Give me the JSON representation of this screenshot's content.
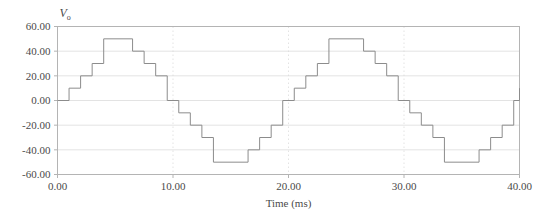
{
  "chart_data": {
    "type": "line",
    "title": "",
    "subtitle": "",
    "xlabel": "Time (ms)",
    "ylabel": "V",
    "ylabel_sub": "o",
    "xlim": [
      0.0,
      40.0
    ],
    "ylim": [
      -60.0,
      60.0
    ],
    "grid": true,
    "legend": false,
    "legend_position": "none",
    "xticks": [
      0.0,
      10.0,
      20.0,
      30.0,
      40.0
    ],
    "xtick_labels": [
      "0.00",
      "10.00",
      "20.00",
      "30.00",
      "40.00"
    ],
    "yticks": [
      -60.0,
      -40.0,
      -20.0,
      0.0,
      20.0,
      40.0,
      60.0
    ],
    "ytick_labels": [
      "-60.00",
      "-40.00",
      "-20.00",
      "0.00",
      "20.00",
      "40.00",
      "60.00"
    ],
    "line_color": "#8c8c8c",
    "grid_color": "#dcdcdc",
    "frame_color": "#b4b4b4",
    "series": [
      {
        "name": "Stepped sine output",
        "step_style": "post",
        "description": "11-level staircase approximation of a sine wave, amplitude 50 V, period 20 ms, two full cycles shown",
        "x": [
          0.0,
          1.0,
          2.0,
          3.0,
          4.0,
          6.5,
          7.5,
          8.5,
          9.5,
          10.5,
          11.5,
          12.5,
          13.5,
          16.5,
          17.5,
          18.5,
          19.5,
          20.5,
          21.5,
          22.5,
          23.5,
          26.5,
          27.5,
          28.5,
          29.5,
          30.5,
          31.5,
          32.5,
          33.5,
          36.5,
          37.5,
          38.5,
          39.5,
          40.0
        ],
        "y": [
          0.0,
          10.0,
          20.0,
          30.0,
          50.0,
          40.0,
          30.0,
          20.0,
          0.0,
          -10.0,
          -20.0,
          -30.0,
          -50.0,
          -40.0,
          -30.0,
          -20.0,
          0.0,
          10.0,
          20.0,
          30.0,
          50.0,
          40.0,
          30.0,
          20.0,
          0.0,
          -10.0,
          -20.0,
          -30.0,
          -50.0,
          -40.0,
          -30.0,
          -20.0,
          0.0,
          10.0
        ]
      }
    ]
  }
}
